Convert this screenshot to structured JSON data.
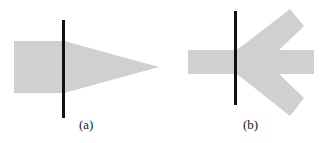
{
  "figure": {
    "panels": [
      {
        "id": "a",
        "caption": "(a)",
        "description": "Rectangle with a triangular taper crossed by a vertical line",
        "fill_color": "#d0d0d0",
        "line_color": "#111111"
      },
      {
        "id": "b",
        "caption": "(b)",
        "description": "Horizontal bar with two diagonal arms forming an arrow shape crossed by a vertical line",
        "fill_color": "#d0d0d0",
        "line_color": "#111111"
      }
    ]
  }
}
